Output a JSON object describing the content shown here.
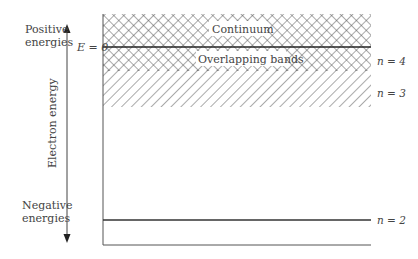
{
  "diagram": {
    "axis": {
      "label": "Electron energy",
      "positive_label_line1": "Positive",
      "positive_label_line2": "energies",
      "negative_label_line1": "Negative",
      "negative_label_line2": "energies"
    },
    "zero_label": "E = 0",
    "regions": {
      "continuum": "Continuum",
      "overlapping": "Overlapping bands"
    },
    "levels": [
      {
        "label": "n = 4"
      },
      {
        "label": "n = 3"
      },
      {
        "label": "n = 2"
      }
    ],
    "colors": {
      "line": "#333333",
      "hatch": "#555555",
      "text": "#444444"
    }
  }
}
